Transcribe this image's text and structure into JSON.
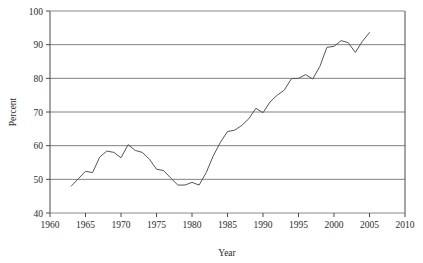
{
  "chart_data": {
    "type": "line",
    "title": "",
    "xlabel": "Year",
    "ylabel": "Percent",
    "xlim": [
      1960,
      2010
    ],
    "ylim": [
      40,
      100
    ],
    "xticks": [
      1960,
      1965,
      1970,
      1975,
      1980,
      1985,
      1990,
      1995,
      2000,
      2005,
      2010
    ],
    "yticks": [
      40,
      50,
      60,
      70,
      80,
      90,
      100
    ],
    "grid": "horizontal",
    "legend": "none",
    "line_color": "#555555",
    "series": [
      {
        "name": "Percent",
        "x": [
          1963,
          1964,
          1965,
          1966,
          1967,
          1968,
          1969,
          1970,
          1971,
          1972,
          1973,
          1974,
          1975,
          1976,
          1977,
          1978,
          1979,
          1980,
          1981,
          1982,
          1983,
          1984,
          1985,
          1986,
          1987,
          1988,
          1989,
          1990,
          1991,
          1992,
          1993,
          1994,
          1995,
          1996,
          1997,
          1998,
          1999,
          2000,
          2001,
          2002,
          2003,
          2004,
          2005
        ],
        "values": [
          48.0,
          50.2,
          52.4,
          52.0,
          56.6,
          58.4,
          58.0,
          56.4,
          60.3,
          58.6,
          58.0,
          56.0,
          53.0,
          52.6,
          50.4,
          48.3,
          48.3,
          49.1,
          48.3,
          52.0,
          57.0,
          61.0,
          64.2,
          64.6,
          66.0,
          68.0,
          71.1,
          69.8,
          73.0,
          75.0,
          76.5,
          79.9,
          80.0,
          81.1,
          79.8,
          83.5,
          89.2,
          89.5,
          91.2,
          90.6,
          87.7,
          91.0,
          93.6
        ]
      }
    ]
  },
  "axis": {
    "y_label": "Percent",
    "x_label": "Year",
    "y_tick_labels": [
      "100",
      "90",
      "80",
      "70",
      "60",
      "50",
      "40"
    ],
    "x_tick_labels": [
      "1960",
      "1965",
      "1970",
      "1975",
      "1980",
      "1985",
      "1990",
      "1995",
      "2000",
      "2005",
      "2010"
    ]
  }
}
